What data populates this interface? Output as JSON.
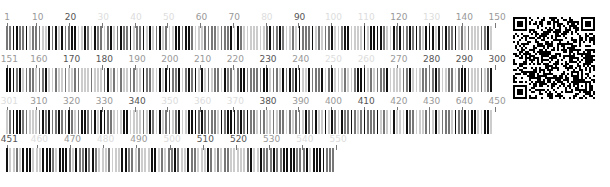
{
  "rows": [
    {
      "start": 1,
      "end": 150,
      "top": 12,
      "width": 491,
      "labels": [
        {
          "text": "1",
          "pos": 0,
          "tone": "mid"
        },
        {
          "text": "10",
          "pos": 9,
          "tone": "mid"
        },
        {
          "text": "20",
          "pos": 19,
          "tone": "dark"
        },
        {
          "text": "30",
          "pos": 29,
          "tone": "faded"
        },
        {
          "text": "40",
          "pos": 39,
          "tone": "faded"
        },
        {
          "text": "50",
          "pos": 49,
          "tone": "faded"
        },
        {
          "text": "60",
          "pos": 59,
          "tone": "mid"
        },
        {
          "text": "70",
          "pos": 69,
          "tone": "mid"
        },
        {
          "text": "80",
          "pos": 79,
          "tone": "faded"
        },
        {
          "text": "90",
          "pos": 89,
          "tone": "dark"
        },
        {
          "text": "100",
          "pos": 99,
          "tone": "faded"
        },
        {
          "text": "110",
          "pos": 109,
          "tone": "faded"
        },
        {
          "text": "120",
          "pos": 119,
          "tone": "mid"
        },
        {
          "text": "130",
          "pos": 129,
          "tone": "faded"
        },
        {
          "text": "140",
          "pos": 139,
          "tone": "mid"
        },
        {
          "text": "150",
          "pos": 149,
          "tone": "mid"
        }
      ]
    },
    {
      "start": 151,
      "end": 300,
      "top": 54,
      "width": 491,
      "labels": [
        {
          "text": "151",
          "pos": 0,
          "tone": "mid"
        },
        {
          "text": "160",
          "pos": 9,
          "tone": "mid"
        },
        {
          "text": "170",
          "pos": 19,
          "tone": "dark"
        },
        {
          "text": "180",
          "pos": 29,
          "tone": "dark"
        },
        {
          "text": "190",
          "pos": 39,
          "tone": "mid"
        },
        {
          "text": "200",
          "pos": 49,
          "tone": "mid"
        },
        {
          "text": "210",
          "pos": 59,
          "tone": "mid"
        },
        {
          "text": "220",
          "pos": 69,
          "tone": "mid"
        },
        {
          "text": "230",
          "pos": 79,
          "tone": "dark"
        },
        {
          "text": "240",
          "pos": 89,
          "tone": "mid"
        },
        {
          "text": "250",
          "pos": 99,
          "tone": "faded"
        },
        {
          "text": "260",
          "pos": 109,
          "tone": "faded"
        },
        {
          "text": "270",
          "pos": 119,
          "tone": "mid"
        },
        {
          "text": "280",
          "pos": 129,
          "tone": "dark"
        },
        {
          "text": "290",
          "pos": 139,
          "tone": "dark"
        },
        {
          "text": "300",
          "pos": 149,
          "tone": "dark"
        }
      ]
    },
    {
      "start": 301,
      "end": 450,
      "top": 96,
      "width": 491,
      "labels": [
        {
          "text": "301",
          "pos": 0,
          "tone": "faded"
        },
        {
          "text": "310",
          "pos": 9,
          "tone": "mid"
        },
        {
          "text": "320",
          "pos": 19,
          "tone": "mid"
        },
        {
          "text": "330",
          "pos": 29,
          "tone": "mid"
        },
        {
          "text": "340",
          "pos": 39,
          "tone": "dark"
        },
        {
          "text": "350",
          "pos": 49,
          "tone": "faded"
        },
        {
          "text": "360",
          "pos": 59,
          "tone": "faded"
        },
        {
          "text": "370",
          "pos": 69,
          "tone": "faded"
        },
        {
          "text": "380",
          "pos": 79,
          "tone": "dark"
        },
        {
          "text": "390",
          "pos": 89,
          "tone": "mid"
        },
        {
          "text": "400",
          "pos": 99,
          "tone": "mid"
        },
        {
          "text": "410",
          "pos": 109,
          "tone": "dark"
        },
        {
          "text": "420",
          "pos": 119,
          "tone": "mid"
        },
        {
          "text": "430",
          "pos": 129,
          "tone": "mid"
        },
        {
          "text": "640",
          "pos": 139,
          "tone": "mid"
        },
        {
          "text": "450",
          "pos": 149,
          "tone": "mid"
        }
      ]
    },
    {
      "start": 451,
      "end": 550,
      "top": 134,
      "width": 332,
      "labels": [
        {
          "text": "451",
          "pos": 0,
          "tone": "dark"
        },
        {
          "text": "460",
          "pos": 9,
          "tone": "faded"
        },
        {
          "text": "470",
          "pos": 19,
          "tone": "mid"
        },
        {
          "text": "480",
          "pos": 29,
          "tone": "faded"
        },
        {
          "text": "490",
          "pos": 39,
          "tone": "mid"
        },
        {
          "text": "500",
          "pos": 49,
          "tone": "faded"
        },
        {
          "text": "510",
          "pos": 59,
          "tone": "dark"
        },
        {
          "text": "520",
          "pos": 69,
          "tone": "dark"
        },
        {
          "text": "530",
          "pos": 79,
          "tone": "mid"
        },
        {
          "text": "540",
          "pos": 89,
          "tone": "faded"
        },
        {
          "text": "550",
          "pos": 99,
          "tone": "faded"
        }
      ]
    }
  ],
  "qr_code": {
    "label": "qr-code"
  },
  "colors": {
    "dark": "#111111",
    "mid": "#777777",
    "light": "#cccccc"
  }
}
